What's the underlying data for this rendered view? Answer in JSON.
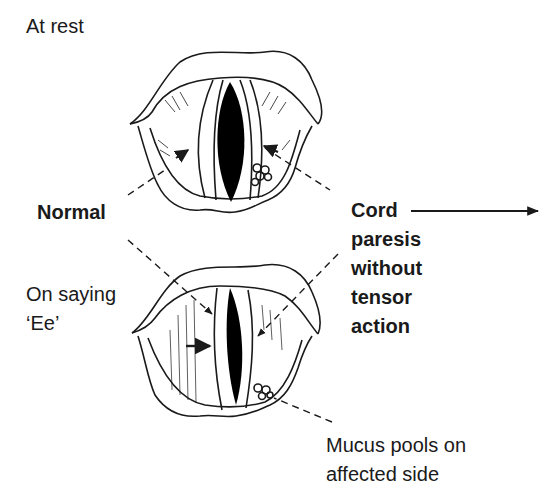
{
  "diagram": {
    "labels": {
      "at_rest": "At rest",
      "normal": "Normal",
      "on_saying_line1": "On saying",
      "on_saying_line2": "‘Ee’",
      "cord_line1": "Cord",
      "cord_line2": "paresis",
      "cord_line3": "without",
      "cord_line4": "tensor",
      "cord_line5": "action",
      "mucus_line1": "Mucus pools on",
      "mucus_line2": "affected side"
    },
    "colors": {
      "ink": "#1a1a1a",
      "background": "#ffffff",
      "glottis": "#000000"
    }
  }
}
